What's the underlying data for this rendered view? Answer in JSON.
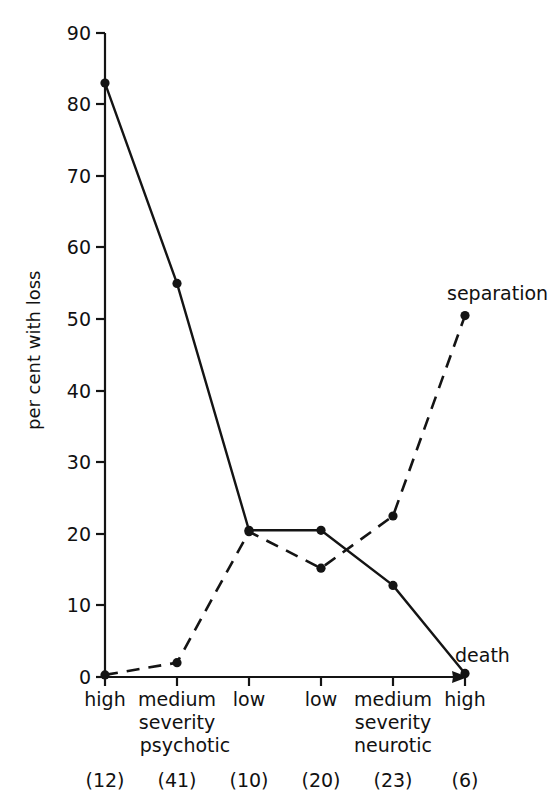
{
  "chart_data": {
    "type": "line",
    "title": "",
    "xlabel": "",
    "ylabel": "per cent with loss",
    "ylim": [
      0,
      90
    ],
    "yticks": [
      0,
      10,
      20,
      30,
      40,
      50,
      60,
      70,
      80,
      90
    ],
    "ytick_labels": [
      "0",
      "10",
      "20",
      "30",
      "40",
      "50",
      "60",
      "70",
      "80",
      "90"
    ],
    "grid": false,
    "legend_position": "inline-right-end-of-line",
    "categories": [
      "high",
      "medium",
      "low",
      "low",
      "medium",
      "high"
    ],
    "category_counts": [
      "(12)",
      "(41)",
      "(10)",
      "(20)",
      "(23)",
      "(6)"
    ],
    "group_labels": [
      {
        "label": "severity",
        "applies_to": "psychotic"
      },
      {
        "label": "psychotic",
        "applies_to": "psychotic"
      },
      {
        "label": "severity",
        "applies_to": "neurotic"
      },
      {
        "label": "neurotic",
        "applies_to": "neurotic"
      }
    ],
    "groups": [
      {
        "name": "psychotic",
        "severity_label": "severity",
        "categories": [
          "high",
          "medium",
          "low"
        ]
      },
      {
        "name": "neurotic",
        "severity_label": "severity",
        "categories": [
          "low",
          "medium",
          "high"
        ]
      }
    ],
    "series": [
      {
        "name": "death",
        "style": "solid",
        "values": [
          83,
          55,
          20.5,
          20.5,
          12.8,
          0.5
        ]
      },
      {
        "name": "separation",
        "style": "dashed",
        "values": [
          0.3,
          2,
          20.3,
          15.2,
          22.5,
          50.5
        ]
      }
    ],
    "annotations": [
      {
        "text": "separation",
        "series": "separation",
        "at_category_index": 5
      },
      {
        "text": "death",
        "series": "death",
        "at_category_index": 5
      }
    ]
  },
  "axis": {
    "y_title": "per cent with loss",
    "y_ticks": [
      "90",
      "80",
      "70",
      "60",
      "50",
      "40",
      "30",
      "20",
      "10",
      "0"
    ]
  },
  "xaxis": {
    "categories": [
      "high",
      "medium",
      "low",
      "low",
      "medium",
      "high"
    ],
    "severity_psychotic": "severity",
    "name_psychotic": "psychotic",
    "severity_neurotic": "severity",
    "name_neurotic": "neurotic",
    "counts": [
      "(12)",
      "(41)",
      "(10)",
      "(20)",
      "(23)",
      "(6)"
    ]
  },
  "series_labels": {
    "separation": "separation",
    "death": "death"
  }
}
